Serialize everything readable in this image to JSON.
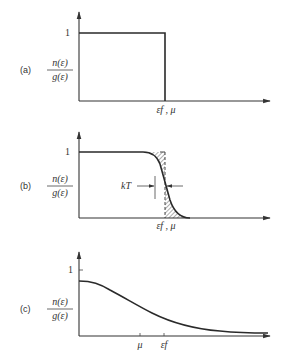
{
  "figure": {
    "panels": [
      {
        "id": "a",
        "panel_label": "(a)",
        "ylabel_num": "n(ε)",
        "ylabel_den": "g(ε)",
        "y_tick_label": "1",
        "x_tick_label": "εf , μ",
        "description": "Step function at T = 0"
      },
      {
        "id": "b",
        "panel_label": "(b)",
        "ylabel_num": "n(ε)",
        "ylabel_den": "g(ε)",
        "y_tick_label": "1",
        "x_tick_label": "εf , μ",
        "annotation": "kT",
        "description": "Smeared Fermi-Dirac distribution, width kT"
      },
      {
        "id": "c",
        "panel_label": "(c)",
        "ylabel_num": "n(ε)",
        "ylabel_den": "g(ε)",
        "y_tick_label": "1",
        "x_tick_labels": [
          "μ",
          "εf"
        ],
        "description": "High temperature distribution"
      }
    ]
  },
  "colors": {
    "ink": "#2a2a2a",
    "background": "#ffffff"
  }
}
